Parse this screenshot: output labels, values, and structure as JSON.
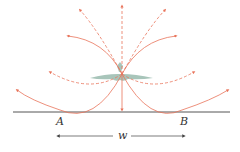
{
  "diagram": {
    "labels": {
      "point_a": "A",
      "point_b": "B",
      "width": "w"
    },
    "colors": {
      "ray": "#e8735a",
      "ground": "#555555",
      "source": "#9fbfb3",
      "dimension": "#444444"
    },
    "elements": {
      "source": "aircraft/source at center above ground",
      "ground": "horizontal ground line",
      "rays_solid": 5,
      "rays_dashed": 4,
      "dimension": "double-headed arrow labeled w between A and B"
    }
  }
}
